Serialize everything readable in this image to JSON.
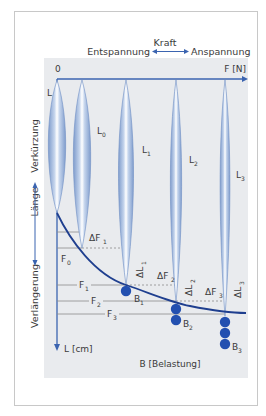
{
  "header": {
    "title": "Kraft",
    "left_label": "Entspannung",
    "right_label": "Anspannung"
  },
  "axes": {
    "x_origin": "0",
    "x_label": "F [N]",
    "y_label": "L [cm]",
    "bottom_label": "B [Belastung]",
    "side_label": "Länge",
    "side_up": "Verkürzung",
    "side_down": "Verlängerung"
  },
  "muscles": [
    {
      "label": "L",
      "sub": ""
    },
    {
      "label": "L",
      "sub": "0"
    },
    {
      "label": "L",
      "sub": "1"
    },
    {
      "label": "L",
      "sub": "2"
    },
    {
      "label": "L",
      "sub": "3"
    }
  ],
  "forces": [
    {
      "label": "F",
      "sub": "0"
    },
    {
      "label": "F",
      "sub": "1"
    },
    {
      "label": "F",
      "sub": "2"
    },
    {
      "label": "F",
      "sub": "3"
    }
  ],
  "delta_forces": [
    {
      "label": "ΔF",
      "sub": "1"
    },
    {
      "label": "ΔF",
      "sub": "2"
    },
    {
      "label": "ΔF",
      "sub": "3"
    }
  ],
  "delta_lengths": [
    {
      "label": "ΔL",
      "sub": "1"
    },
    {
      "label": "ΔL",
      "sub": "2"
    },
    {
      "label": "ΔL",
      "sub": "3"
    }
  ],
  "loads": [
    {
      "label": "B",
      "sub": "1",
      "count": 1
    },
    {
      "label": "B",
      "sub": "2",
      "count": 2
    },
    {
      "label": "B",
      "sub": "3",
      "count": 3
    }
  ],
  "colors": {
    "panel": "#e9ebee",
    "axis": "#3b64b0",
    "curve": "#1f3f8f",
    "ball": "#2350b0",
    "spindle_edge": "#7f9ccc",
    "spindle_fill": "#b9cbe6",
    "line": "#8a8a8a"
  }
}
